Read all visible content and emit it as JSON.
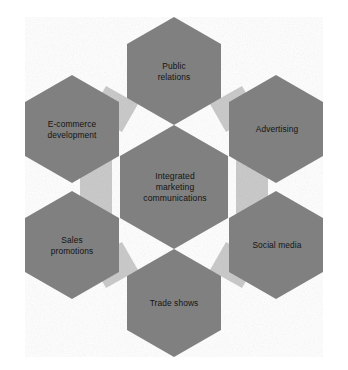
{
  "diagram": {
    "type": "hexagon-cluster",
    "background_color": "#ffffff",
    "hexagon_fill_color": "#808080",
    "connector_fill_color": "#c8c8c8",
    "label_color": "#141414",
    "center": {
      "id": "integrated-marketing-communications",
      "label": "Integrated\nmarketing\ncommunications",
      "cx": 174,
      "cy": 187,
      "radius": 63
    },
    "nodes": [
      {
        "id": "public-relations",
        "label": "Public\nrelations",
        "position": "top",
        "cx": 174,
        "cy": 71,
        "radius": 55
      },
      {
        "id": "advertising",
        "label": "Advertising",
        "position": "top-right",
        "cx": 276,
        "cy": 129,
        "radius": 55
      },
      {
        "id": "social-media",
        "label": "Social media",
        "position": "bottom-right",
        "cx": 276,
        "cy": 245,
        "radius": 55
      },
      {
        "id": "trade-shows",
        "label": "Trade shows",
        "position": "bottom",
        "cx": 174,
        "cy": 303,
        "radius": 55
      },
      {
        "id": "sales-promotions",
        "label": "Sales\npromotions",
        "position": "bottom-left",
        "cx": 72,
        "cy": 245,
        "radius": 55
      },
      {
        "id": "e-commerce-development",
        "label": "E-commerce\ndevelopment",
        "position": "top-left",
        "cx": 72,
        "cy": 129,
        "radius": 55
      }
    ],
    "connectors": [
      {
        "id": "connector-top-left",
        "points": "106,88 134,104 120,128 92,112"
      },
      {
        "id": "connector-top-right",
        "points": "242,88 214,104 228,128 256,112"
      },
      {
        "id": "connector-right",
        "points": "238,155 266,171 266,203 238,219"
      },
      {
        "id": "connector-bottom-right",
        "points": "242,286 214,270 228,246 256,262"
      },
      {
        "id": "connector-bottom-left",
        "points": "106,286 134,270 120,246 92,262"
      },
      {
        "id": "connector-left",
        "points": "110,155 82,171 82,203 110,219"
      }
    ]
  }
}
